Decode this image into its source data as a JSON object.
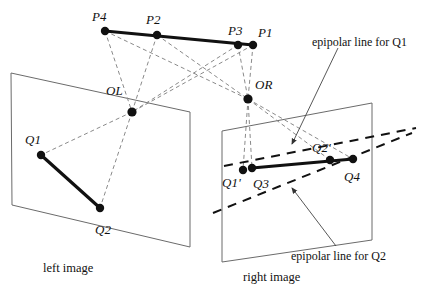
{
  "figure": {
    "colors": {
      "ink": "#111111",
      "plane_edge": "#6b6b6b",
      "ray_dashed": "#8a8a8a",
      "epipolar_dashed": "#111111",
      "background": "#ffffff"
    }
  },
  "scene_points": [
    {
      "id": "P4",
      "label": "P4",
      "x": 105,
      "y": 31,
      "label_x": 92,
      "label_y": 10
    },
    {
      "id": "P2",
      "label": "P2",
      "x": 157,
      "y": 35,
      "label_x": 146,
      "label_y": 13
    },
    {
      "id": "P3",
      "label": "P3",
      "x": 238,
      "y": 45,
      "label_x": 228,
      "label_y": 24
    },
    {
      "id": "P1",
      "label": "P1",
      "x": 253,
      "y": 45,
      "label_x": 258,
      "label_y": 26
    }
  ],
  "camera_centers": [
    {
      "id": "OL",
      "label": "O",
      "sub": "L",
      "x": 132,
      "y": 112,
      "label_x": 106,
      "label_y": 84
    },
    {
      "id": "OR",
      "label": "O",
      "sub": "R",
      "x": 248,
      "y": 99,
      "label_x": 255,
      "label_y": 78
    }
  ],
  "left_plane": {
    "name": "left image",
    "caption": "left image",
    "caption_x": 43,
    "caption_y": 262,
    "corners": [
      [
        11,
        73
      ],
      [
        190,
        112
      ],
      [
        190,
        247
      ],
      [
        12,
        205
      ]
    ],
    "points": [
      {
        "id": "Q1",
        "label": "Q1",
        "x": 41,
        "y": 155,
        "label_x": 25,
        "label_y": 133
      },
      {
        "id": "Q2",
        "label": "Q2",
        "x": 100,
        "y": 208,
        "label_x": 95,
        "label_y": 223
      }
    ],
    "segment": {
      "from": "Q1",
      "to": "Q2"
    }
  },
  "right_plane": {
    "name": "right image",
    "caption": "right image",
    "caption_x": 243,
    "caption_y": 271,
    "corners": [
      [
        222,
        131
      ],
      [
        372,
        103
      ],
      [
        372,
        240
      ],
      [
        222,
        262
      ]
    ],
    "points": [
      {
        "id": "Q1p",
        "label": "Q1'",
        "x": 243,
        "y": 170,
        "label_x": 222,
        "label_y": 176
      },
      {
        "id": "Q3",
        "label": "Q3",
        "x": 252,
        "y": 168,
        "label_x": 253,
        "label_y": 177
      },
      {
        "id": "Q2p",
        "label": "Q2'",
        "x": 330,
        "y": 160,
        "label_x": 312,
        "label_y": 141
      },
      {
        "id": "Q4",
        "label": "Q4",
        "x": 353,
        "y": 159,
        "label_x": 344,
        "label_y": 170
      }
    ],
    "segment": {
      "from": "Q3",
      "to": "Q4"
    }
  },
  "epipolar_lines": [
    {
      "id": "epi-q1",
      "label": "epipolar line for Q1",
      "label_x": 312,
      "label_y": 36,
      "from": [
        224,
        166
      ],
      "to": [
        416,
        128
      ],
      "leader_from": [
        338,
        48
      ],
      "leader_to": [
        292,
        144
      ]
    },
    {
      "id": "epi-q2",
      "label": "epipolar line for Q2",
      "label_x": 291,
      "label_y": 250,
      "from": [
        213,
        213
      ],
      "to": [
        412,
        133
      ],
      "leader_from": [
        336,
        246
      ],
      "leader_to": [
        292,
        188
      ]
    }
  ],
  "projection_rays": [
    {
      "from": [
        105,
        31
      ],
      "to": [
        132,
        112
      ]
    },
    {
      "from": [
        157,
        35
      ],
      "to": [
        132,
        112
      ]
    },
    {
      "from": [
        238,
        45
      ],
      "to": [
        132,
        112
      ]
    },
    {
      "from": [
        253,
        45
      ],
      "to": [
        132,
        112
      ]
    },
    {
      "from": [
        105,
        31
      ],
      "to": [
        248,
        99
      ]
    },
    {
      "from": [
        157,
        35
      ],
      "to": [
        248,
        99
      ]
    },
    {
      "from": [
        238,
        45
      ],
      "to": [
        248,
        99
      ]
    },
    {
      "from": [
        253,
        45
      ],
      "to": [
        248,
        99
      ]
    },
    {
      "from": [
        132,
        112
      ],
      "to": [
        41,
        155
      ]
    },
    {
      "from": [
        132,
        112
      ],
      "to": [
        100,
        208
      ]
    },
    {
      "from": [
        248,
        99
      ],
      "to": [
        243,
        170
      ]
    },
    {
      "from": [
        248,
        99
      ],
      "to": [
        252,
        168
      ]
    },
    {
      "from": [
        248,
        99
      ],
      "to": [
        330,
        160
      ]
    },
    {
      "from": [
        248,
        99
      ],
      "to": [
        353,
        159
      ]
    }
  ]
}
